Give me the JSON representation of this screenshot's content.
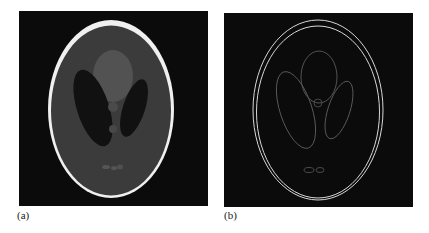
{
  "figure": {
    "panels": [
      {
        "label": "(a)",
        "description": "Shepp-Logan phantom",
        "colors": {
          "background": "#0b0b0b",
          "skull_rim": "#f0f0f0",
          "brain": "#3b3b3b",
          "top_region": "#525252",
          "dark_ellipses": "#111111",
          "small_features": "#555555"
        }
      },
      {
        "label": "(b)",
        "description": "Edge map of phantom",
        "colors": {
          "background": "#0b0b0b",
          "outer_edges": "#d8d8d8",
          "inner_edges": "#5a5a5a"
        }
      }
    ]
  }
}
